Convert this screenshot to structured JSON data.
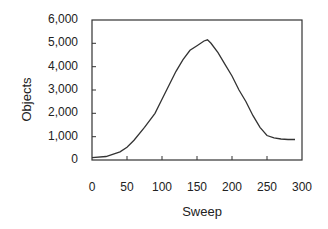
{
  "chart_data": {
    "type": "line",
    "title": "",
    "xlabel": "Sweep",
    "ylabel": "Objects",
    "xlim": [
      0,
      300
    ],
    "ylim": [
      0,
      6000
    ],
    "x_ticks": [
      "0",
      "50",
      "100",
      "150",
      "200",
      "250",
      "300"
    ],
    "y_ticks": [
      "0",
      "1,000",
      "2,000",
      "3,000",
      "4,000",
      "5,000",
      "6,000"
    ],
    "grid": false,
    "legend": null,
    "series": [
      {
        "name": "Objects",
        "x": [
          0,
          20,
          40,
          50,
          60,
          75,
          90,
          100,
          110,
          120,
          130,
          140,
          150,
          160,
          165,
          170,
          180,
          190,
          200,
          210,
          220,
          230,
          240,
          250,
          260,
          270,
          280,
          290
        ],
        "values": [
          100,
          150,
          350,
          550,
          850,
          1400,
          2000,
          2600,
          3200,
          3800,
          4300,
          4700,
          4900,
          5100,
          5150,
          5000,
          4600,
          4100,
          3600,
          3000,
          2500,
          1900,
          1400,
          1050,
          950,
          900,
          880,
          880
        ]
      }
    ]
  }
}
